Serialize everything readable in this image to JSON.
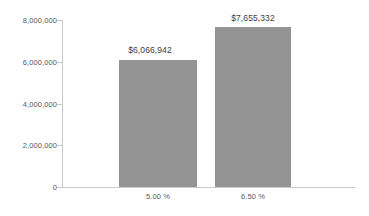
{
  "chart_data": {
    "type": "bar",
    "title": "",
    "subtitle": "",
    "xlabel": "",
    "ylabel": "",
    "categories": [
      "5.00 %",
      "6.50 %"
    ],
    "values": [
      6066942,
      7655332
    ],
    "value_labels": [
      "$6,066,942",
      "$7,655,332"
    ],
    "series": [
      {
        "name": "",
        "values": [
          6066942,
          7655332
        ]
      }
    ],
    "ylim": [
      0,
      8000000
    ],
    "y_ticks": [
      0,
      2000000,
      4000000,
      6000000,
      8000000
    ],
    "y_tick_labels": [
      "0",
      "2,000,000",
      "4,000,000",
      "6,000,000",
      "8,000,000"
    ],
    "grid": false,
    "legend": false,
    "legend_position": "none",
    "bar_color": "#949494",
    "axis_color": "#c9c9c9",
    "tick_label_color": "#58585a",
    "value_label_color": "#3c3c3e",
    "background_color": "#ffffff"
  }
}
